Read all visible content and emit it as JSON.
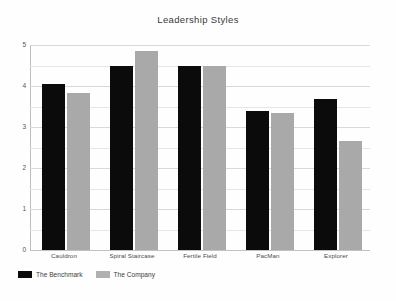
{
  "chart_data": {
    "type": "bar",
    "title": "Leadership Styles",
    "xlabel": "",
    "ylabel": "",
    "ylim": [
      0,
      5
    ],
    "grid": true,
    "legend_position": "bottom-left",
    "ytick_labels": [
      "5",
      "4",
      "3",
      "2",
      "1",
      "0"
    ],
    "ytick_values": [
      5,
      4,
      3,
      2,
      1,
      0
    ],
    "minor_tick_values": [
      4.5,
      3.5,
      2.5,
      1.5,
      0.5
    ],
    "categories": [
      "Cauldron",
      "Spiral Staircase",
      "Fertile Field",
      "PacMan",
      "Explorer"
    ],
    "series": [
      {
        "name": "The Benchmark",
        "color": "#0b0b0b",
        "values": [
          4.05,
          4.5,
          4.5,
          3.4,
          3.68
        ]
      },
      {
        "name": "The Company",
        "color": "#a9a9a9",
        "values": [
          3.82,
          4.85,
          4.48,
          3.34,
          2.67
        ]
      }
    ]
  },
  "legend": {
    "items": [
      {
        "label": "The Benchmark",
        "swatch": "benchmark"
      },
      {
        "label": "The Company",
        "swatch": "company"
      }
    ]
  }
}
